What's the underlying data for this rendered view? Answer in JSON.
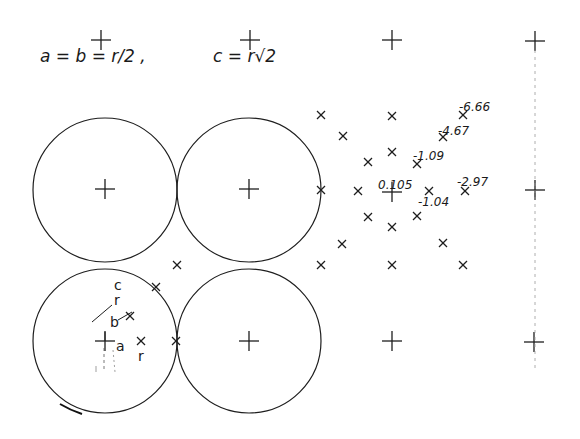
{
  "formula": {
    "left": "a = b = r/2 ,",
    "right": "c = r√2"
  },
  "circles": [
    {
      "cx": 105,
      "cy": 190,
      "r": 72
    },
    {
      "cx": 249,
      "cy": 190,
      "r": 72
    },
    {
      "cx": 105,
      "cy": 341,
      "r": 72
    },
    {
      "cx": 249,
      "cy": 341,
      "r": 72
    }
  ],
  "plus_markers": [
    {
      "x": 101,
      "y": 40
    },
    {
      "x": 250,
      "y": 40
    },
    {
      "x": 392,
      "y": 40
    },
    {
      "x": 535,
      "y": 41
    },
    {
      "x": 105,
      "y": 189
    },
    {
      "x": 249,
      "y": 189
    },
    {
      "x": 392,
      "y": 192
    },
    {
      "x": 535,
      "y": 190
    },
    {
      "x": 105,
      "y": 341
    },
    {
      "x": 249,
      "y": 341
    },
    {
      "x": 392,
      "y": 341
    },
    {
      "x": 534,
      "y": 342
    }
  ],
  "x_markers": [
    {
      "x": 321,
      "y": 115
    },
    {
      "x": 392,
      "y": 116
    },
    {
      "x": 463,
      "y": 115
    },
    {
      "x": 343,
      "y": 136
    },
    {
      "x": 443,
      "y": 137
    },
    {
      "x": 368,
      "y": 162
    },
    {
      "x": 392,
      "y": 152
    },
    {
      "x": 417,
      "y": 164
    },
    {
      "x": 321,
      "y": 190
    },
    {
      "x": 358,
      "y": 191
    },
    {
      "x": 429,
      "y": 191
    },
    {
      "x": 465,
      "y": 191
    },
    {
      "x": 368,
      "y": 217
    },
    {
      "x": 392,
      "y": 227
    },
    {
      "x": 417,
      "y": 216
    },
    {
      "x": 342,
      "y": 244
    },
    {
      "x": 443,
      "y": 243
    },
    {
      "x": 321,
      "y": 265
    },
    {
      "x": 392,
      "y": 265
    },
    {
      "x": 463,
      "y": 265
    },
    {
      "x": 177,
      "y": 265
    },
    {
      "x": 156,
      "y": 287
    },
    {
      "x": 130,
      "y": 316
    },
    {
      "x": 141,
      "y": 341
    },
    {
      "x": 176,
      "y": 341
    }
  ],
  "value_labels": [
    {
      "text": "-6.66",
      "x": 459,
      "y": 111
    },
    {
      "text": "-4.67",
      "x": 438,
      "y": 135
    },
    {
      "text": "-1.09",
      "x": 413,
      "y": 160
    },
    {
      "text": "0.105",
      "x": 378,
      "y": 189
    },
    {
      "text": "-1.04",
      "x": 418,
      "y": 206
    },
    {
      "text": "-2.97",
      "x": 457,
      "y": 186
    }
  ],
  "inner_labels": {
    "c": "c",
    "r_top": "r",
    "b": "b",
    "a": "a",
    "r_right": "r"
  }
}
